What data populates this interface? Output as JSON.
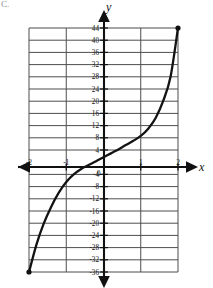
{
  "figure": {
    "corner_label": "C.",
    "axis_labels": {
      "x": "x",
      "y": "y"
    }
  },
  "chart_data": {
    "type": "line",
    "title": "",
    "xlabel": "x",
    "ylabel": "y",
    "xlim": [
      -2,
      2
    ],
    "ylim": [
      -36,
      44
    ],
    "grid": true,
    "grid_x_step": 1,
    "grid_y_step": 4,
    "legend": "none",
    "x_ticks": [
      -2,
      -1,
      0,
      1,
      2
    ],
    "x_tick_labels": [
      "-2",
      "-1",
      "0",
      "1",
      "2"
    ],
    "y_ticks": [
      44,
      40,
      36,
      32,
      28,
      24,
      20,
      16,
      12,
      8,
      4,
      -4,
      -8,
      -12,
      -16,
      -20,
      -24,
      -28,
      -32,
      -36
    ],
    "y_tick_labels": [
      "44",
      "40",
      "36",
      "32",
      "28",
      "24",
      "20",
      "16",
      "12",
      "8",
      "4",
      "-4",
      "-8",
      "-12",
      "-16",
      "-20",
      "-24",
      "-28",
      "-32",
      "-36"
    ],
    "series": [
      {
        "name": "curve",
        "style": "smooth-cubic",
        "endpoints_marked": true,
        "x": [
          -2.0,
          -1.8,
          -1.6,
          -1.4,
          -1.2,
          -1.0,
          -0.8,
          -0.6,
          -0.4,
          -0.2,
          0.0,
          0.2,
          0.4,
          0.6,
          0.8,
          1.0,
          1.2,
          1.4,
          1.6,
          1.8,
          2.0
        ],
        "y": [
          -36.0,
          -27.0,
          -20.0,
          -14.5,
          -10.0,
          -6.5,
          -4.0,
          -2.2,
          -0.9,
          0.3,
          1.6,
          2.9,
          4.2,
          5.6,
          7.0,
          8.6,
          11.0,
          14.5,
          20.0,
          28.0,
          44.0
        ]
      }
    ],
    "marked_points": [
      {
        "x": -2,
        "y": -36
      },
      {
        "x": 2,
        "y": 44
      }
    ]
  }
}
